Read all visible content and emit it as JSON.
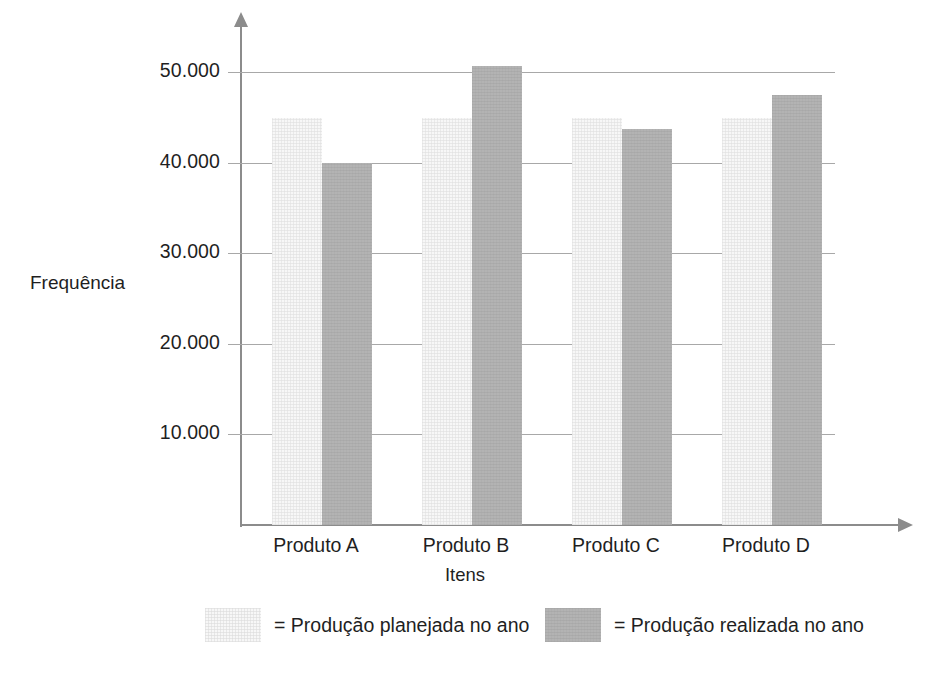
{
  "chart_data": {
    "type": "bar",
    "title": "",
    "xlabel": "Itens",
    "ylabel": "Frequência",
    "categories": [
      "Produto A",
      "Produto B",
      "Produto C",
      "Produto D"
    ],
    "ytick_labels": [
      "10.000",
      "20.000",
      "30.000",
      "40.000",
      "50.000"
    ],
    "ytick_values": [
      10000,
      20000,
      30000,
      40000,
      50000
    ],
    "ylim": [
      0,
      56000
    ],
    "grid": true,
    "legend_position": "bottom",
    "series": [
      {
        "name": "Produção planejada no ano",
        "legend_label": "= Produção planejada no ano",
        "color": "#f7f7f7",
        "values": [
          45000,
          45000,
          45000,
          45000
        ]
      },
      {
        "name": "Produção realizada no ano",
        "legend_label": "= Produção realizada no ano",
        "color": "#b3b3b3",
        "values": [
          40000,
          50700,
          43700,
          47500
        ]
      }
    ]
  },
  "axes": {
    "y_axis_name": "frequencia-axis",
    "x_axis_name": "itens-axis",
    "axis_color": "#8c8c8c",
    "gridline_color": "#a8a8a8"
  }
}
